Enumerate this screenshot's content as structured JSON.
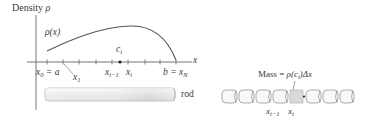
{
  "left_panel": {
    "y_axis_label": "Density",
    "y_axis_symbol": "ρ",
    "x_axis_label": "x",
    "curve_label": "ρ(x)",
    "point_label": {
      "base": "c",
      "sub": "i"
    },
    "tick_labels": [
      {
        "base": "x",
        "sub": "0",
        "suffix": " = a"
      },
      {
        "base": "x",
        "sub": "1",
        "suffix": ""
      },
      {
        "base": "x",
        "sub": "i−1",
        "suffix": ""
      },
      {
        "base": "x",
        "sub": "i",
        "suffix": ""
      },
      {
        "prefix": "b = ",
        "base": "x",
        "sub": "N"
      }
    ],
    "rod_label": "rod"
  },
  "right_panel": {
    "mass_formula": {
      "text": "Mass = ",
      "rho": "ρ(c",
      "sub": "i",
      "tail": ")Δx"
    },
    "segment_labels": [
      {
        "base": "x",
        "sub": "i−1"
      },
      {
        "base": "x",
        "sub": "i"
      }
    ],
    "segment_count": 8,
    "highlighted_segment_index": 4
  },
  "colors": {
    "axis": "#555555",
    "curve": "#555555",
    "rod_fill_light": "#f4f4f4",
    "rod_fill_dark": "#d6d6d6",
    "highlight": "#d9d9d9"
  }
}
